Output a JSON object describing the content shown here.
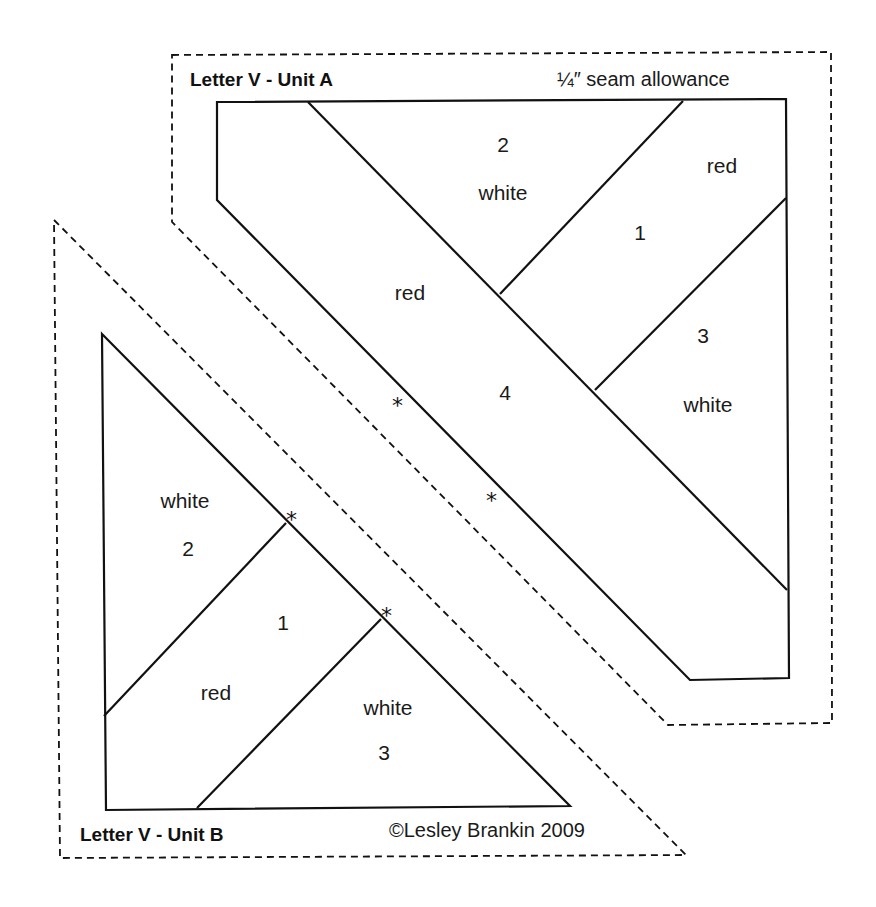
{
  "unit_a": {
    "title": "Letter V - Unit A",
    "seam_note": "¼″ seam allowance",
    "pieces": [
      {
        "number": "1",
        "color": "red"
      },
      {
        "number": "2",
        "color": "white"
      },
      {
        "number": "3",
        "color": "white"
      },
      {
        "number": "4",
        "color": "red"
      }
    ]
  },
  "unit_b": {
    "title": "Letter V - Unit B",
    "copyright": "©Lesley Brankin 2009",
    "pieces": [
      {
        "number": "1",
        "color": "red"
      },
      {
        "number": "2",
        "color": "white"
      },
      {
        "number": "3",
        "color": "white"
      }
    ]
  },
  "markers": {
    "alignment_star": "*"
  },
  "colors": {
    "line": "#111111",
    "background": "#ffffff"
  }
}
